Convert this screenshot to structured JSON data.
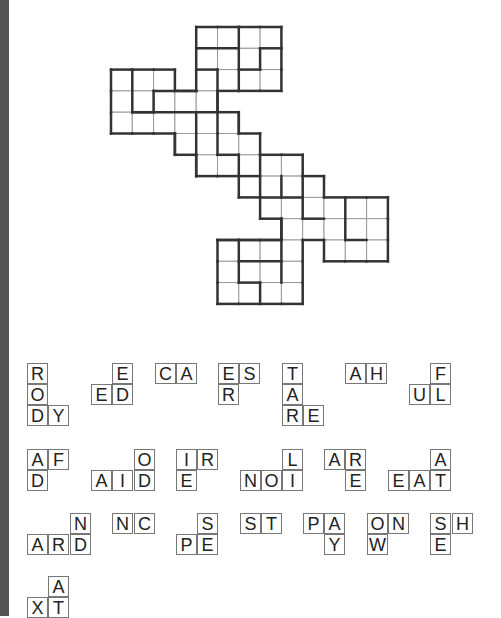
{
  "puzzle": {
    "type": "fill-in grid with word fragments",
    "grid": {
      "origin": [
        111,
        27
      ],
      "cell": 21.3,
      "rows": [
        {
          "r": 0,
          "cols": [
            4,
            5,
            6,
            7
          ]
        },
        {
          "r": 1,
          "cols": [
            4,
            5,
            6,
            7
          ]
        },
        {
          "r": 2,
          "cols": [
            0,
            1,
            2,
            4,
            5,
            6,
            7
          ]
        },
        {
          "r": 3,
          "cols": [
            0,
            1,
            2,
            3,
            4
          ]
        },
        {
          "r": 4,
          "cols": [
            0,
            1,
            2,
            3,
            4,
            5
          ]
        },
        {
          "r": 5,
          "cols": [
            3,
            4,
            5,
            6
          ]
        },
        {
          "r": 6,
          "cols": [
            4,
            5,
            6,
            7,
            8
          ]
        },
        {
          "r": 7,
          "cols": [
            6,
            7,
            8,
            9
          ]
        },
        {
          "r": 8,
          "cols": [
            7,
            8,
            9,
            10,
            11,
            12
          ]
        },
        {
          "r": 9,
          "cols": [
            8,
            9,
            10,
            11,
            12
          ]
        },
        {
          "r": 10,
          "cols": [
            5,
            6,
            7,
            8,
            10,
            11,
            12
          ]
        },
        {
          "r": 11,
          "cols": [
            5,
            6,
            7,
            8
          ]
        },
        {
          "r": 12,
          "cols": [
            5,
            6,
            7,
            8
          ]
        }
      ],
      "thick_segments": [
        [
          4,
          1,
          6,
          1
        ],
        [
          7,
          1,
          8,
          1
        ],
        [
          6,
          0,
          6,
          3
        ],
        [
          7,
          1,
          7,
          2
        ],
        [
          6,
          2,
          7,
          2
        ],
        [
          4,
          2,
          5,
          2
        ],
        [
          5,
          2,
          5,
          5
        ],
        [
          1,
          2,
          1,
          4
        ],
        [
          1,
          4,
          2,
          4
        ],
        [
          2,
          3,
          4,
          3
        ],
        [
          2,
          3,
          2,
          4
        ],
        [
          1,
          4,
          5,
          4
        ],
        [
          3,
          5,
          3,
          6
        ],
        [
          4,
          4,
          4,
          7
        ],
        [
          5,
          5,
          5,
          6
        ],
        [
          5,
          6,
          6,
          6
        ],
        [
          6,
          4,
          6,
          5
        ],
        [
          6,
          6,
          6,
          7
        ],
        [
          6,
          7,
          7,
          7
        ],
        [
          7,
          6,
          7,
          8
        ],
        [
          7,
          8,
          9,
          8
        ],
        [
          8,
          7,
          8,
          8
        ],
        [
          9,
          7,
          9,
          8
        ],
        [
          9,
          8,
          9,
          9
        ],
        [
          9,
          9,
          10,
          9
        ],
        [
          11,
          8,
          11,
          10
        ],
        [
          11,
          10,
          12,
          10
        ],
        [
          8,
          9,
          8,
          11
        ],
        [
          8,
          10,
          5,
          10
        ],
        [
          6,
          10,
          6,
          12
        ],
        [
          6,
          11,
          8,
          11
        ],
        [
          8,
          11,
          8,
          12
        ],
        [
          7,
          12,
          7,
          13
        ],
        [
          7,
          12,
          6,
          12
        ]
      ]
    },
    "pieces": [
      {
        "tiles": [
          {
            "x": 27,
            "y": 363,
            "t": "R"
          },
          {
            "x": 27,
            "y": 384,
            "t": "O"
          },
          {
            "x": 27,
            "y": 405,
            "t": "D"
          },
          {
            "x": 48,
            "y": 405,
            "t": "Y"
          }
        ]
      },
      {
        "tiles": [
          {
            "x": 112,
            "y": 363,
            "t": "E"
          },
          {
            "x": 91,
            "y": 384,
            "t": "E"
          },
          {
            "x": 112,
            "y": 384,
            "t": "D"
          }
        ]
      },
      {
        "tiles": [
          {
            "x": 155,
            "y": 363,
            "t": "C"
          },
          {
            "x": 176,
            "y": 363,
            "t": "A"
          }
        ]
      },
      {
        "tiles": [
          {
            "x": 218,
            "y": 363,
            "t": "E"
          },
          {
            "x": 239,
            "y": 363,
            "t": "S"
          },
          {
            "x": 218,
            "y": 384,
            "t": "R"
          }
        ]
      },
      {
        "tiles": [
          {
            "x": 282,
            "y": 363,
            "t": "T"
          },
          {
            "x": 282,
            "y": 384,
            "t": "A"
          },
          {
            "x": 282,
            "y": 405,
            "t": "R"
          },
          {
            "x": 303,
            "y": 405,
            "t": "E"
          }
        ]
      },
      {
        "tiles": [
          {
            "x": 345,
            "y": 363,
            "t": "A"
          },
          {
            "x": 366,
            "y": 363,
            "t": "H"
          }
        ]
      },
      {
        "tiles": [
          {
            "x": 430,
            "y": 363,
            "t": "F"
          },
          {
            "x": 409,
            "y": 384,
            "t": "U"
          },
          {
            "x": 430,
            "y": 384,
            "t": "L"
          }
        ]
      },
      {
        "tiles": [
          {
            "x": 27,
            "y": 449,
            "t": "A"
          },
          {
            "x": 48,
            "y": 449,
            "t": "F"
          },
          {
            "x": 27,
            "y": 470,
            "t": "D"
          }
        ]
      },
      {
        "tiles": [
          {
            "x": 134,
            "y": 449,
            "t": "O"
          },
          {
            "x": 91,
            "y": 470,
            "t": "A"
          },
          {
            "x": 112,
            "y": 470,
            "t": "I"
          },
          {
            "x": 134,
            "y": 470,
            "t": "D"
          }
        ]
      },
      {
        "tiles": [
          {
            "x": 176,
            "y": 449,
            "t": "I"
          },
          {
            "x": 197,
            "y": 449,
            "t": "R"
          },
          {
            "x": 176,
            "y": 470,
            "t": "E"
          }
        ]
      },
      {
        "tiles": [
          {
            "x": 282,
            "y": 449,
            "t": "L"
          },
          {
            "x": 240,
            "y": 470,
            "t": "N"
          },
          {
            "x": 261,
            "y": 470,
            "t": "O"
          },
          {
            "x": 282,
            "y": 470,
            "t": "I"
          }
        ]
      },
      {
        "tiles": [
          {
            "x": 324,
            "y": 449,
            "t": "A"
          },
          {
            "x": 345,
            "y": 449,
            "t": "R"
          },
          {
            "x": 345,
            "y": 470,
            "t": "E"
          }
        ]
      },
      {
        "tiles": [
          {
            "x": 430,
            "y": 449,
            "t": "A"
          },
          {
            "x": 388,
            "y": 470,
            "t": "E"
          },
          {
            "x": 409,
            "y": 470,
            "t": "A"
          },
          {
            "x": 430,
            "y": 470,
            "t": "T"
          }
        ]
      },
      {
        "tiles": [
          {
            "x": 70,
            "y": 513,
            "t": "N"
          },
          {
            "x": 27,
            "y": 534,
            "t": "A"
          },
          {
            "x": 48,
            "y": 534,
            "t": "R"
          },
          {
            "x": 70,
            "y": 534,
            "t": "D"
          }
        ]
      },
      {
        "tiles": [
          {
            "x": 112,
            "y": 513,
            "t": "N"
          },
          {
            "x": 134,
            "y": 513,
            "t": "C"
          }
        ]
      },
      {
        "tiles": [
          {
            "x": 197,
            "y": 513,
            "t": "S"
          },
          {
            "x": 176,
            "y": 534,
            "t": "P"
          },
          {
            "x": 197,
            "y": 534,
            "t": "E"
          }
        ]
      },
      {
        "tiles": [
          {
            "x": 240,
            "y": 513,
            "t": "S"
          },
          {
            "x": 261,
            "y": 513,
            "t": "T"
          }
        ]
      },
      {
        "tiles": [
          {
            "x": 303,
            "y": 513,
            "t": "P"
          },
          {
            "x": 324,
            "y": 513,
            "t": "A"
          },
          {
            "x": 324,
            "y": 534,
            "t": "Y"
          }
        ]
      },
      {
        "tiles": [
          {
            "x": 367,
            "y": 513,
            "t": "O"
          },
          {
            "x": 388,
            "y": 513,
            "t": "N"
          },
          {
            "x": 367,
            "y": 534,
            "t": "W"
          }
        ]
      },
      {
        "tiles": [
          {
            "x": 430,
            "y": 513,
            "t": "S"
          },
          {
            "x": 452,
            "y": 513,
            "t": "H"
          },
          {
            "x": 430,
            "y": 534,
            "t": "E"
          }
        ]
      },
      {
        "tiles": [
          {
            "x": 48,
            "y": 576,
            "t": "A"
          },
          {
            "x": 27,
            "y": 597,
            "t": "X"
          },
          {
            "x": 48,
            "y": 597,
            "t": "T"
          }
        ]
      }
    ]
  }
}
